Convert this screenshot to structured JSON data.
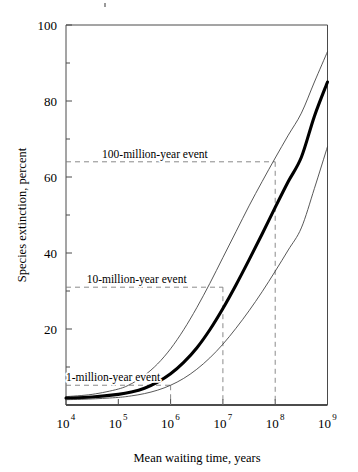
{
  "figure": {
    "background_color": "#ffffff",
    "main_curve_color": "#000000",
    "bound_curve_color": "#3a3a3a",
    "guide_line_color": "#7d7d7d",
    "frame_color": "#4a4a4a"
  },
  "chart_data": {
    "type": "line",
    "title": "",
    "subtitle": "",
    "xlabel": "Mean waiting time, years",
    "ylabel": "Species extinction, percent",
    "x_scale": "log10",
    "xlim": [
      4,
      9
    ],
    "ylim": [
      0,
      100
    ],
    "grid": false,
    "legend_position": "none",
    "x_tick_base": "10",
    "x_tick_exponents": [
      "4",
      "5",
      "6",
      "7",
      "8",
      "9"
    ],
    "x_tick_values": [
      4,
      5,
      6,
      7,
      8,
      9
    ],
    "y_ticks_major": [
      0,
      20,
      40,
      60,
      80,
      100
    ],
    "y_tick_labels": [
      "",
      "20",
      "40",
      "60",
      "80",
      "100"
    ],
    "y_ticks_minor": [
      10,
      30,
      50,
      70,
      90
    ],
    "series": [
      {
        "name": "upper-bound",
        "style": "thin",
        "points": [
          [
            4.0,
            2.2
          ],
          [
            4.5,
            2.8
          ],
          [
            5.0,
            4.2
          ],
          [
            5.25,
            5.6
          ],
          [
            5.5,
            7.8
          ],
          [
            5.75,
            10.8
          ],
          [
            6.0,
            14.8
          ],
          [
            6.25,
            19.8
          ],
          [
            6.5,
            25.6
          ],
          [
            6.75,
            32.0
          ],
          [
            7.0,
            38.8
          ],
          [
            7.25,
            45.6
          ],
          [
            7.5,
            52.4
          ],
          [
            7.75,
            58.8
          ],
          [
            8.0,
            65.0
          ],
          [
            8.25,
            71.0
          ],
          [
            8.5,
            76.8
          ],
          [
            8.75,
            85.0
          ],
          [
            9.0,
            93.0
          ]
        ]
      },
      {
        "name": "best-estimate",
        "style": "thick",
        "points": [
          [
            4.0,
            1.8
          ],
          [
            4.5,
            2.1
          ],
          [
            5.0,
            2.8
          ],
          [
            5.25,
            3.4
          ],
          [
            5.5,
            4.4
          ],
          [
            5.75,
            6.0
          ],
          [
            6.0,
            8.2
          ],
          [
            6.25,
            11.2
          ],
          [
            6.5,
            15.0
          ],
          [
            6.75,
            19.8
          ],
          [
            7.0,
            25.4
          ],
          [
            7.25,
            31.6
          ],
          [
            7.5,
            38.2
          ],
          [
            7.75,
            45.0
          ],
          [
            8.0,
            52.0
          ],
          [
            8.25,
            58.8
          ],
          [
            8.5,
            65.2
          ],
          [
            8.75,
            76.0
          ],
          [
            9.0,
            85.0
          ]
        ]
      },
      {
        "name": "lower-bound",
        "style": "thin",
        "points": [
          [
            4.0,
            1.4
          ],
          [
            4.5,
            1.6
          ],
          [
            5.0,
            2.0
          ],
          [
            5.25,
            2.4
          ],
          [
            5.5,
            3.0
          ],
          [
            5.75,
            3.9
          ],
          [
            6.0,
            5.2
          ],
          [
            6.25,
            7.0
          ],
          [
            6.5,
            9.4
          ],
          [
            6.75,
            12.4
          ],
          [
            7.0,
            16.0
          ],
          [
            7.25,
            20.2
          ],
          [
            7.5,
            24.8
          ],
          [
            7.75,
            29.8
          ],
          [
            8.0,
            35.2
          ],
          [
            8.25,
            40.8
          ],
          [
            8.5,
            46.6
          ],
          [
            8.75,
            57.0
          ],
          [
            9.0,
            68.0
          ]
        ]
      }
    ],
    "annotations": [
      {
        "label": "100-million-year event",
        "y_value": 64.0,
        "x_marker": 8.0,
        "label_x": 5.7,
        "horizontal_guide": true,
        "vertical_guide": true
      },
      {
        "label": "10-million-year event",
        "y_value": 31.0,
        "x_marker": 7.0,
        "label_x": 5.35,
        "horizontal_guide": true,
        "vertical_guide": true
      },
      {
        "label": "1-million-year event",
        "y_value": 5.2,
        "x_marker": 6.0,
        "label_x": 4.9,
        "horizontal_guide": true,
        "vertical_guide": true
      }
    ]
  }
}
